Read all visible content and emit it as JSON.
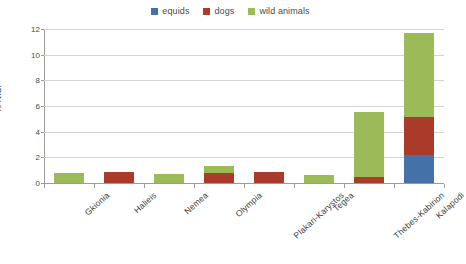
{
  "chart_data": {
    "type": "bar",
    "stacked": true,
    "title": "",
    "xlabel": "",
    "ylabel": "% NISP",
    "ylim": [
      0,
      12
    ],
    "yticks": [
      0,
      2,
      4,
      6,
      8,
      10,
      12
    ],
    "grid": true,
    "legend_position": "top-center",
    "categories": [
      "Gkionia",
      "Halieis",
      "Nemea",
      "Olympia",
      "Plakari-Karystos",
      "Tegea",
      "Thebes-Kabirion",
      "Kalapodi"
    ],
    "series": [
      {
        "name": "equids",
        "color": "#4472a8",
        "values": [
          0,
          0,
          0,
          0,
          0,
          0,
          0,
          2.2
        ]
      },
      {
        "name": "dogs",
        "color": "#aa3b2a",
        "values": [
          0,
          0.85,
          0,
          0.8,
          0.85,
          0,
          0.5,
          2.95
        ]
      },
      {
        "name": "wild animals",
        "color": "#9bbb59",
        "values": [
          0.8,
          0,
          0.7,
          0.55,
          0,
          0.6,
          5.0,
          6.55
        ]
      }
    ],
    "totals": [
      0.8,
      0.85,
      0.7,
      1.35,
      0.85,
      0.6,
      5.5,
      11.7
    ]
  }
}
